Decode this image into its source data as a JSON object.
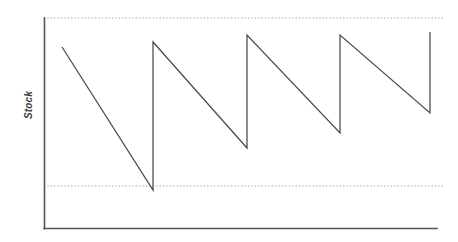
{
  "chart_data": {
    "type": "line",
    "title": "",
    "subtitle": "",
    "xlabel": "",
    "ylabel": "Stock",
    "xlim": [
      0,
      400
    ],
    "ylim": [
      0,
      100
    ],
    "grid": false,
    "legend": "none",
    "legend_position": "none",
    "series": [
      {
        "name": "Stock level",
        "shape": "sawtooth",
        "points": [
          {
            "x": 18,
            "y": 86
          },
          {
            "x": 109,
            "y": 18
          },
          {
            "x": 109,
            "y": 89
          },
          {
            "x": 203,
            "y": 38
          },
          {
            "x": 203,
            "y": 92
          },
          {
            "x": 296,
            "y": 45
          },
          {
            "x": 296,
            "y": 92
          },
          {
            "x": 386,
            "y": 55
          },
          {
            "x": 386,
            "y": 93
          }
        ]
      }
    ],
    "reference_lines": [
      {
        "name": "maximum-stock-level",
        "y": 100,
        "style": "dotted"
      },
      {
        "name": "minimum-stock-level",
        "y": 20,
        "style": "dotted"
      }
    ],
    "axis_ticks": {
      "x": [],
      "y": []
    },
    "annotations": []
  },
  "axes": {
    "y_title": "Stock",
    "x_title": ""
  },
  "colors": {
    "line": "#4a4a4a",
    "axis": "#555555",
    "dotted": "#9a9a9a",
    "background": "#ffffff",
    "label": "#3c3c3c"
  },
  "geometry": {
    "plot_left": 44,
    "plot_right": 437,
    "plot_top": 18,
    "plot_bottom": 228,
    "upper_dotted_y": 18,
    "lower_dotted_y": 186,
    "dotted_right": 445,
    "sawtooth_path": "M 62,47 L 153,190 L 153,42 L 247,148 L 247,35 L 340,133 L 340,35 L 430,113 L 430,32"
  }
}
